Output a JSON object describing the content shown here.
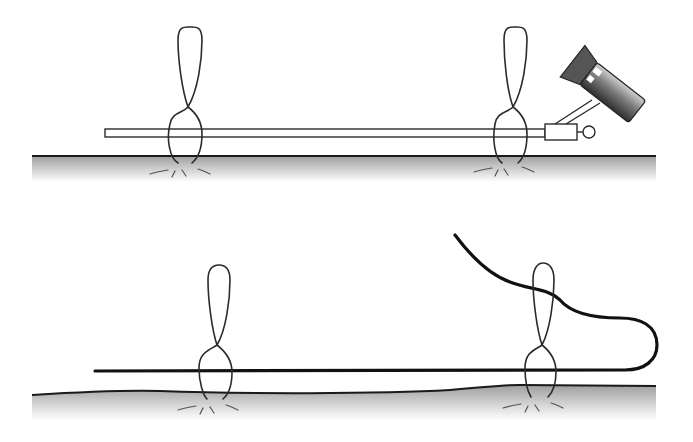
{
  "figure": {
    "panels": [
      {
        "id": "top",
        "description": "Rigid rod held by two suture loops above tissue surface, attached to angled camera/scope instrument",
        "elements": [
          "tissue-surface",
          "rigid-rod",
          "suture-loop-left",
          "suture-loop-right",
          "scope-instrument"
        ]
      },
      {
        "id": "bottom",
        "description": "Flexible wire passed through two suture loops above undulating tissue surface, wire curving back out",
        "elements": [
          "tissue-surface",
          "flexible-wire",
          "suture-loop-left",
          "suture-loop-right"
        ]
      }
    ],
    "colors": {
      "line": "#2b2b2b",
      "tissue_top": "#a8a8a8",
      "tissue_bottom": "#ffffff",
      "instrument_dark": "#3a3a3a",
      "instrument_light": "#bdbdbd"
    }
  }
}
